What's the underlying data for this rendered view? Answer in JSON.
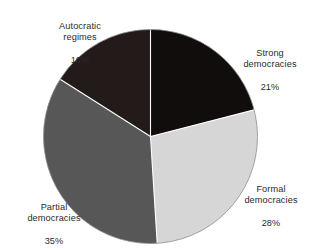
{
  "chart_data": {
    "type": "pie",
    "title": "",
    "subtitle": "",
    "xlabel": "",
    "ylabel": "",
    "legend_position": "none",
    "grid": false,
    "units": "percent",
    "start_angle_deg": 0,
    "direction": "clockwise",
    "categories": [
      "Strong democracies",
      "Formal democracies",
      "Partial democracies",
      "Autocratic regimes"
    ],
    "values": [
      21,
      28,
      35,
      16
    ],
    "slices": [
      {
        "label": "Strong democracies",
        "value": 21,
        "value_text": "21%",
        "color": "#120d0d",
        "start_deg": 0,
        "end_deg": 75.6
      },
      {
        "label": "Formal democracies",
        "value": 28,
        "value_text": "28%",
        "color": "#d6d6d6",
        "start_deg": 75.6,
        "end_deg": 176.4
      },
      {
        "label": "Partial democracies",
        "value": 35,
        "value_text": "35%",
        "color": "#575757",
        "start_deg": 176.4,
        "end_deg": 302.4
      },
      {
        "label": "Autocratic regimes",
        "value": 16,
        "value_text": "16%",
        "color": "#231a1a",
        "start_deg": 302.4,
        "end_deg": 360
      }
    ]
  },
  "labels": {
    "autocratic": {
      "name": "Autocratic\nregimes",
      "value": "16%"
    },
    "strong": {
      "name": "Strong\ndemocracies",
      "value": "21%"
    },
    "formal": {
      "name": "Formal\ndemocracies",
      "value": "28%"
    },
    "partial": {
      "name": "Partial\ndemocracies",
      "value": "35%"
    }
  },
  "colors": {
    "background": "#ffffff",
    "text": "#2a2a2a",
    "slice_strong": "#120d0d",
    "slice_formal": "#d6d6d6",
    "slice_partial": "#575757",
    "slice_autocratic": "#231a1a",
    "separator": "#ffffff",
    "outline": "#8e8e8e"
  }
}
